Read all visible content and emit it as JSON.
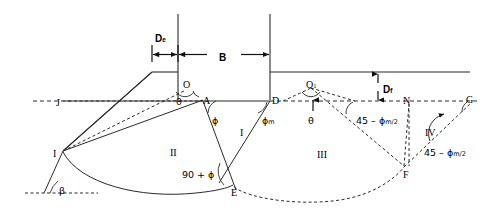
{
  "figure": {
    "type": "engineering-diagram",
    "background_color": "#ffffff",
    "line_color": "#2b2b2b"
  },
  "dimensions": {
    "d_e": "D",
    "d_e_sub": "e",
    "b": "B",
    "d_f": "D",
    "d_f_sub": "f"
  },
  "points": [
    {
      "id": "J",
      "label": "J",
      "x": 61,
      "y": 101
    },
    {
      "id": "O",
      "label": "O",
      "x": 186,
      "y": 84
    },
    {
      "id": "A",
      "label": "A",
      "x": 203,
      "y": 100
    },
    {
      "id": "D",
      "label": "D",
      "x": 283,
      "y": 100
    },
    {
      "id": "O1",
      "label": "O",
      "sub": "1",
      "x": 311,
      "y": 84
    },
    {
      "id": "N",
      "label": "N",
      "x": 409,
      "y": 101
    },
    {
      "id": "G",
      "label": "G",
      "x": 481,
      "y": 101
    },
    {
      "id": "I",
      "label": "I",
      "x": 63,
      "y": 151
    },
    {
      "id": "E",
      "label": "E",
      "x": 233,
      "y": 186
    },
    {
      "id": "F",
      "label": "F",
      "x": 404,
      "y": 166
    }
  ],
  "regions": [
    {
      "id": "I",
      "label": "I"
    },
    {
      "id": "II",
      "label": "II"
    },
    {
      "id": "III",
      "label": "III"
    },
    {
      "id": "IV",
      "label": "IV"
    }
  ],
  "angles": [
    {
      "id": "theta-left",
      "label": "θ",
      "at": "O"
    },
    {
      "id": "theta-right",
      "label": "θ",
      "at": "O1"
    },
    {
      "id": "phi-A",
      "label": "ϕ",
      "at": "A"
    },
    {
      "id": "phi-m-D",
      "label": "ϕ",
      "sub": "m",
      "at": "D"
    },
    {
      "id": "beta",
      "label": "β",
      "at": "I"
    },
    {
      "id": "ninety-plus-phi",
      "label": "90 + ϕ",
      "at": "E"
    },
    {
      "id": "forty-five-minus-phi-m-2-left",
      "label": "45 – ϕ",
      "sub": "m/2",
      "at": "N"
    },
    {
      "id": "forty-five-minus-phi-m-2-right",
      "label": "45 – ϕ",
      "sub": "m/2",
      "at": "G"
    }
  ],
  "labels": {
    "region_I": "I",
    "region_II": "II",
    "region_III": "III",
    "region_IV": "IV",
    "point_J": "J",
    "point_O": "O",
    "point_A": "A",
    "point_D": "D",
    "point_O1": "O",
    "point_O1_sub": "1",
    "point_N": "N",
    "point_G": "G",
    "point_I": "I",
    "point_E": "E",
    "point_F": "F",
    "theta_left": "θ",
    "theta_right": "θ",
    "phi_A": "ϕ",
    "phi_m_base": "ϕ",
    "phi_m_sub": "m",
    "beta": "β",
    "ninety_plus_phi": "90 + ϕ",
    "angle45_base": "45 – ϕ",
    "angle45_sub": "m/2",
    "dim_De_base": "D",
    "dim_De_sub": "e",
    "dim_B": "B",
    "dim_Df_base": "D",
    "dim_Df_sub": "f"
  }
}
